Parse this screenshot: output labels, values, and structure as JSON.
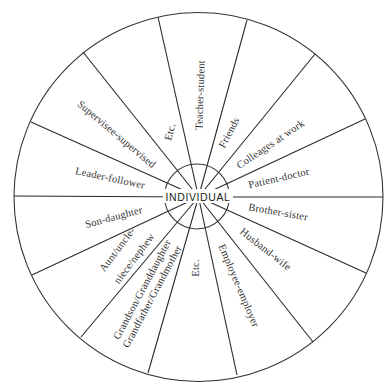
{
  "diagram": {
    "center_label": "INDIVIDUAL",
    "segments": [
      {
        "label": "Teacher-student"
      },
      {
        "label": "Friends"
      },
      {
        "label": "Colleages at work"
      },
      {
        "label": "Patient-doctor"
      },
      {
        "label": "Brother-sister"
      },
      {
        "label": "Husband-wife"
      },
      {
        "label": "Employee-employer"
      },
      {
        "label": "Etc."
      },
      {
        "line1": "Grandson/Granddaughter",
        "line2": "Grandfather/Grandmother"
      },
      {
        "line1": "Aunt/uncle-",
        "line2": "niece/nephew"
      },
      {
        "label": "Son-daughter"
      },
      {
        "label": "Leader-follower"
      },
      {
        "label": "Supervisee-supervised"
      },
      {
        "label": "Etc."
      }
    ]
  },
  "colors": {
    "line": "#2a2a2a",
    "text": "#333333",
    "background": "#ffffff"
  }
}
